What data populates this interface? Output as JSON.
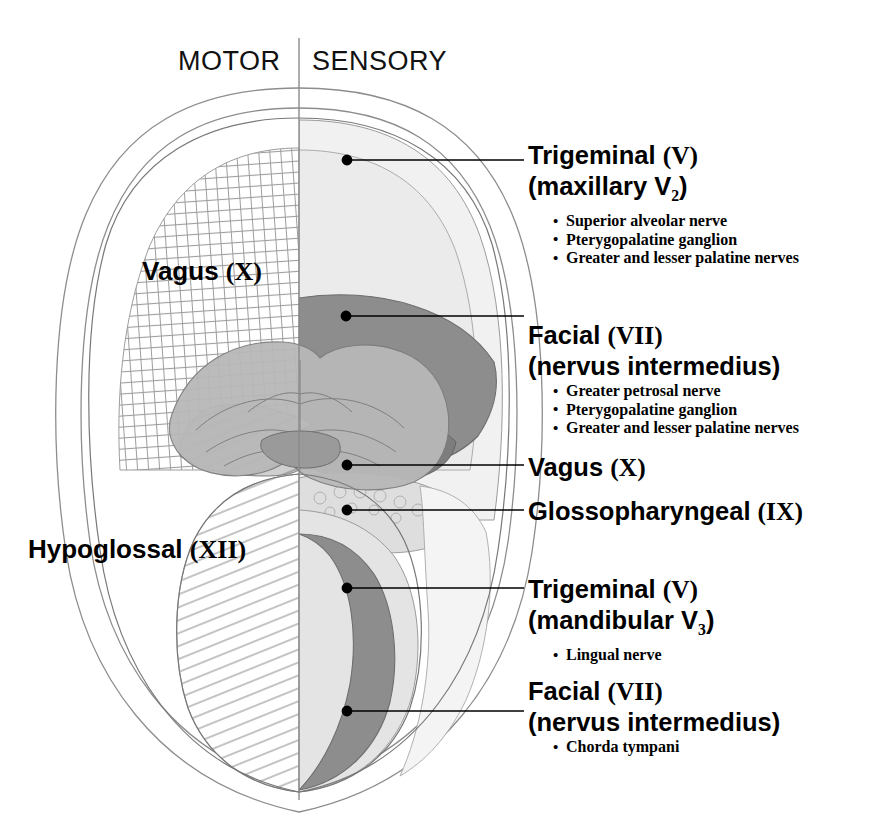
{
  "figure": {
    "headers": {
      "left": "MOTOR",
      "right": "SENSORY"
    },
    "midline_divider": true,
    "colors": {
      "outline": "#6b6b6b",
      "very_light_region": "#f1f1f1",
      "light_region": "#e2e2e2",
      "mid_region": "#c8c8c8",
      "dark_band": "#8d8d8d",
      "darkest_region": "#7a7a7a",
      "hatch_line": "#9a9a9a",
      "leader_line": "#000000",
      "text": "#000000"
    }
  },
  "motor_labels": [
    {
      "name": "Vagus",
      "numeral": "(X)",
      "x": 142,
      "y": 256
    },
    {
      "name": "Hypoglossal",
      "numeral": "(XII)",
      "x": 28,
      "y": 534
    }
  ],
  "callouts": [
    {
      "id": "trigeminal-v2",
      "title": "Trigeminal (V)",
      "title_name": "Trigeminal",
      "title_numeral": "(V)",
      "subtitle_prefix": "(maxillary V",
      "subtitle_sub": "2",
      "subtitle_suffix": ")",
      "bullets": [
        "Superior alveolar nerve",
        "Pterygopalatine ganglion",
        "Greater and lesser palatine nerves"
      ],
      "dot": {
        "x": 347,
        "y": 160
      },
      "line_to_x": 524
    },
    {
      "id": "facial-vii-1",
      "title": "Facial (VII)",
      "title_name": "Facial",
      "title_numeral": "(VII)",
      "subtitle_prefix": "(nervus intermedius)",
      "subtitle_sub": "",
      "subtitle_suffix": "",
      "bullets": [
        "Greater petrosal nerve",
        "Pterygopalatine ganglion",
        "Greater and lesser palatine nerves"
      ],
      "dot": {
        "x": 346,
        "y": 316
      },
      "line_to_x": 524
    },
    {
      "id": "vagus-x",
      "title": "Vagus (X)",
      "title_name": "Vagus",
      "title_numeral": "(X)",
      "subtitle_prefix": "",
      "subtitle_sub": "",
      "subtitle_suffix": "",
      "bullets": [],
      "dot": {
        "x": 347,
        "y": 465
      },
      "line_to_x": 524
    },
    {
      "id": "glossopharyngeal-ix",
      "title": "Glossopharyngeal (IX)",
      "title_name": "Glossopharyngeal",
      "title_numeral": "(IX)",
      "subtitle_prefix": "",
      "subtitle_sub": "",
      "subtitle_suffix": "",
      "bullets": [],
      "dot": {
        "x": 347,
        "y": 510
      },
      "line_to_x": 524
    },
    {
      "id": "trigeminal-v3",
      "title": "Trigeminal (V)",
      "title_name": "Trigeminal",
      "title_numeral": "(V)",
      "subtitle_prefix": "(mandibular V",
      "subtitle_sub": "3",
      "subtitle_suffix": ")",
      "bullets": [
        "Lingual nerve"
      ],
      "dot": {
        "x": 347,
        "y": 588
      },
      "line_to_x": 524
    },
    {
      "id": "facial-vii-2",
      "title": "Facial (VII)",
      "title_name": "Facial",
      "title_numeral": "(VII)",
      "subtitle_prefix": "(nervus intermedius)",
      "subtitle_sub": "",
      "subtitle_suffix": "",
      "bullets": [
        "Chorda tympani"
      ],
      "dot": {
        "x": 347,
        "y": 711
      },
      "line_to_x": 524
    }
  ]
}
